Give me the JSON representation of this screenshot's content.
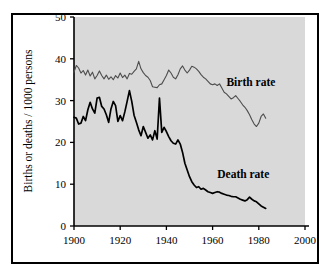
{
  "chart_data": {
    "type": "line",
    "title": "",
    "xlabel": "",
    "ylabel": "Births or deaths / 1000 persons",
    "xlim": [
      1900,
      2000
    ],
    "ylim": [
      0,
      50
    ],
    "xticks": [
      1900,
      1920,
      1940,
      1960,
      1980,
      2000
    ],
    "yticks": [
      0,
      10,
      20,
      30,
      40,
      50
    ],
    "grid": false,
    "legend_position": "inline-annotation",
    "plot_background": "#d9d9d9",
    "frame_color": "#000000",
    "annotations": [
      {
        "text": "Birth rate",
        "x": 1966,
        "y": 33.5
      },
      {
        "text": "Death rate",
        "x": 1962,
        "y": 11.5
      }
    ],
    "series": [
      {
        "name": "Birth rate",
        "color": "#4d4d4d",
        "line_width": 1.1,
        "x": [
          1900,
          1901,
          1902,
          1903,
          1904,
          1905,
          1906,
          1907,
          1908,
          1909,
          1910,
          1911,
          1912,
          1913,
          1914,
          1915,
          1916,
          1917,
          1918,
          1919,
          1920,
          1921,
          1922,
          1923,
          1924,
          1925,
          1926,
          1927,
          1928,
          1929,
          1930,
          1931,
          1932,
          1933,
          1934,
          1935,
          1936,
          1937,
          1938,
          1939,
          1940,
          1941,
          1942,
          1943,
          1944,
          1945,
          1946,
          1947,
          1948,
          1949,
          1950,
          1951,
          1952,
          1953,
          1954,
          1955,
          1956,
          1957,
          1958,
          1959,
          1960,
          1961,
          1962,
          1963,
          1964,
          1965,
          1966,
          1967,
          1968,
          1969,
          1970,
          1971,
          1972,
          1973,
          1974,
          1975,
          1976,
          1977,
          1978,
          1979,
          1980,
          1981,
          1982,
          1983
        ],
        "values": [
          36.8,
          38.4,
          37.8,
          36.6,
          37.2,
          36.1,
          37.3,
          35.9,
          36.8,
          35.2,
          36.0,
          37.1,
          36.0,
          35.2,
          36.1,
          35.1,
          35.7,
          35.0,
          36.0,
          35.4,
          36.6,
          35.5,
          36.1,
          35.2,
          36.5,
          36.3,
          37.0,
          37.6,
          39.4,
          37.6,
          36.7,
          36.0,
          35.6,
          34.8,
          33.3,
          33.2,
          33.1,
          33.8,
          34.0,
          35.0,
          36.0,
          37.3,
          36.6,
          35.6,
          35.2,
          36.2,
          37.6,
          38.3,
          37.3,
          36.6,
          37.3,
          38.2,
          38.0,
          37.6,
          37.0,
          36.2,
          35.6,
          35.2,
          34.6,
          34.0,
          33.8,
          34.0,
          33.6,
          34.0,
          33.0,
          32.0,
          31.6,
          31.0,
          30.4,
          30.7,
          31.2,
          30.5,
          29.8,
          29.0,
          28.4,
          27.6,
          26.6,
          25.4,
          24.4,
          23.8,
          24.6,
          26.2,
          26.8,
          25.8
        ]
      },
      {
        "name": "Death rate",
        "color": "#000000",
        "line_width": 1.7,
        "x": [
          1900,
          1901,
          1902,
          1903,
          1904,
          1905,
          1906,
          1907,
          1908,
          1909,
          1910,
          1911,
          1912,
          1913,
          1914,
          1915,
          1916,
          1917,
          1918,
          1919,
          1920,
          1921,
          1922,
          1923,
          1924,
          1925,
          1926,
          1927,
          1928,
          1929,
          1930,
          1931,
          1932,
          1933,
          1934,
          1935,
          1936,
          1937,
          1938,
          1939,
          1940,
          1941,
          1942,
          1943,
          1944,
          1945,
          1946,
          1947,
          1948,
          1949,
          1950,
          1951,
          1952,
          1953,
          1954,
          1955,
          1956,
          1957,
          1958,
          1959,
          1960,
          1961,
          1962,
          1963,
          1964,
          1965,
          1966,
          1967,
          1968,
          1969,
          1970,
          1971,
          1972,
          1973,
          1974,
          1975,
          1976,
          1977,
          1978,
          1979,
          1980,
          1981,
          1982,
          1983
        ],
        "values": [
          26.0,
          25.8,
          24.4,
          24.6,
          26.2,
          25.2,
          27.8,
          29.6,
          28.0,
          27.0,
          30.6,
          30.8,
          28.6,
          28.0,
          26.6,
          24.8,
          28.0,
          29.8,
          28.8,
          25.0,
          26.4,
          25.2,
          27.3,
          29.8,
          32.4,
          29.8,
          26.5,
          24.8,
          23.0,
          21.6,
          23.8,
          22.4,
          21.0,
          21.8,
          20.6,
          22.8,
          20.8,
          30.6,
          22.4,
          23.6,
          22.6,
          21.4,
          20.4,
          19.8,
          19.6,
          20.6,
          19.6,
          17.6,
          15.0,
          13.4,
          11.8,
          10.6,
          9.8,
          9.2,
          9.4,
          8.8,
          9.0,
          8.6,
          8.2,
          8.0,
          7.8,
          8.0,
          8.2,
          8.1,
          7.8,
          7.6,
          7.4,
          7.3,
          7.1,
          7.0,
          7.0,
          6.7,
          6.4,
          6.2,
          6.0,
          6.3,
          6.9,
          6.4,
          6.0,
          5.8,
          5.3,
          4.8,
          4.5,
          4.2
        ]
      }
    ]
  }
}
